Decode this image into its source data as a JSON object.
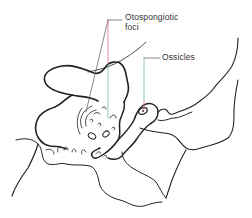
{
  "diagram": {
    "title": "",
    "labels": [
      {
        "id": "otospongiotic-foci",
        "text_line1": "Otospongiotic",
        "text_line2": "foci"
      },
      {
        "id": "ossicles",
        "text": "Ossicles"
      }
    ],
    "colors": {
      "outline": "#222222",
      "leader_line": "#555555",
      "leader_accent_red": "#e05a6a",
      "leader_accent_teal": "#6aa8b0",
      "background": "#ffffff"
    }
  }
}
